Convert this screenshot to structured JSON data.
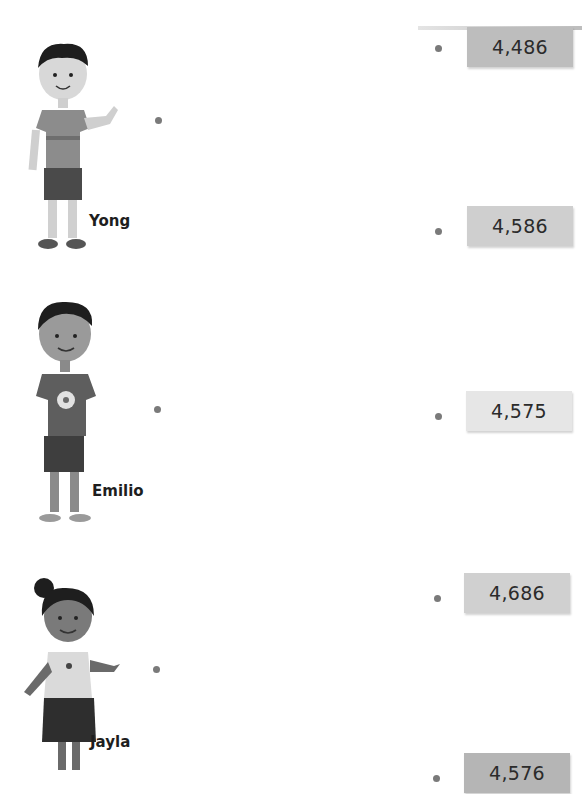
{
  "children": [
    {
      "name": "Yong"
    },
    {
      "name": "Emilio"
    },
    {
      "name": "Jayla"
    }
  ],
  "numbers": [
    {
      "value": "4,486",
      "color": "#bdbdbd"
    },
    {
      "value": "4,586",
      "color": "#cfcfcf"
    },
    {
      "value": "4,575",
      "color": "#e6e6e6"
    },
    {
      "value": "4,686",
      "color": "#d0d0d0"
    },
    {
      "value": "4,576",
      "color": "#b5b5b5"
    }
  ],
  "colors": {
    "dot": "#7a7a7a",
    "text": "#2b2b2b"
  }
}
